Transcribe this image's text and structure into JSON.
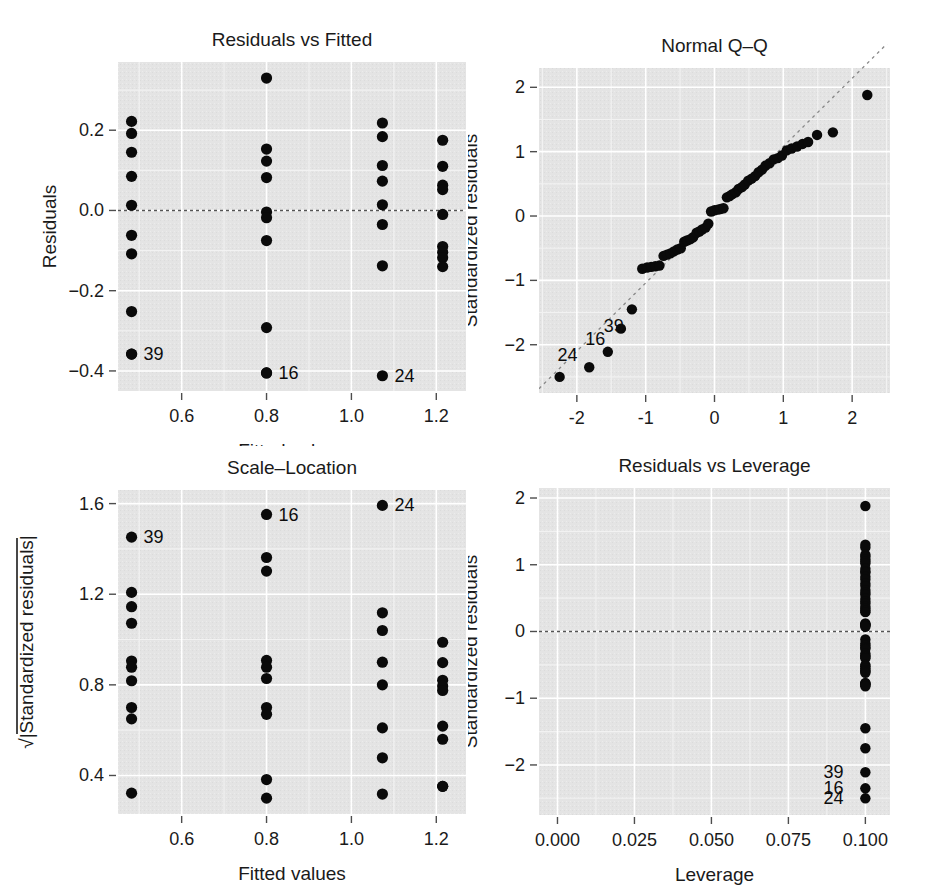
{
  "figure": {
    "width": 935,
    "height": 891,
    "background": "#ffffff",
    "panel_background": "#e4e4e4",
    "grid_color": "#ffffff",
    "point_color": "#0a0a0a",
    "reference_line_color": "#555555"
  },
  "chart_data": [
    {
      "id": "residuals-vs-fitted",
      "type": "scatter",
      "title": "Residuals vs Fitted",
      "xlabel": "Fitted values",
      "ylabel": "Residuals",
      "xlim": [
        0.45,
        1.27
      ],
      "ylim": [
        -0.45,
        0.37
      ],
      "xticks": [
        0.6,
        0.8,
        1.0,
        1.2
      ],
      "xticklabels": [
        "0.6",
        "0.8",
        "1.0",
        "1.2"
      ],
      "yticks": [
        0.2,
        0.0,
        -0.2,
        -0.4
      ],
      "yticklabels": [
        "0.2",
        "0.0",
        "-0.2",
        "-0.4"
      ],
      "grid": true,
      "legend": "none",
      "hline": 0.0,
      "x": [
        0.482,
        0.482,
        0.482,
        0.482,
        0.482,
        0.482,
        0.482,
        0.482,
        0.482,
        0.482,
        0.8,
        0.8,
        0.8,
        0.8,
        0.8,
        0.8,
        0.8,
        0.8,
        0.8,
        0.8,
        1.073,
        1.073,
        1.073,
        1.073,
        1.073,
        1.073,
        1.073,
        1.073,
        1.215,
        1.215,
        1.215,
        1.215,
        1.215,
        1.215,
        1.215,
        1.215,
        1.215
      ],
      "y": [
        0.222,
        0.192,
        0.145,
        0.085,
        0.013,
        -0.062,
        -0.108,
        -0.252,
        -0.358,
        -0.358,
        0.33,
        0.153,
        0.123,
        0.082,
        -0.004,
        -0.018,
        -0.075,
        -0.292,
        -0.405,
        -0.405,
        0.218,
        0.184,
        0.112,
        0.073,
        0.014,
        -0.035,
        -0.138,
        -0.412,
        0.175,
        0.11,
        0.063,
        0.052,
        -0.01,
        -0.09,
        -0.104,
        -0.118,
        -0.14
      ],
      "annotations": [
        {
          "label": "39",
          "x": 0.482,
          "y": -0.358,
          "dx": 12,
          "dy": 6
        },
        {
          "label": "16",
          "x": 0.8,
          "y": -0.405,
          "dx": 12,
          "dy": 6
        },
        {
          "label": "24",
          "x": 1.073,
          "y": -0.412,
          "dx": 12,
          "dy": 6
        }
      ]
    },
    {
      "id": "normal-qq",
      "type": "scatter",
      "title": "Normal Q-Q",
      "xlabel": "Theoretical quantiles",
      "ylabel": "Standardized residuals",
      "xlim": [
        -2.55,
        2.55
      ],
      "ylim": [
        -2.75,
        2.3
      ],
      "xticks": [
        -2,
        -1,
        0,
        1,
        2
      ],
      "xticklabels": [
        "-2",
        "-1",
        "0",
        "1",
        "2"
      ],
      "yticks": [
        2,
        1,
        0,
        -1,
        -2
      ],
      "yticklabels": [
        "2",
        "1",
        "0",
        "-1",
        "-2"
      ],
      "grid": true,
      "legend": "none",
      "qqline": {
        "slope": 1.06,
        "intercept": 0.02,
        "style": "dashed"
      },
      "x": [
        -2.25,
        -1.82,
        -1.55,
        -1.36,
        -1.2,
        -1.05,
        -0.98,
        -0.92,
        -0.86,
        -0.8,
        -0.74,
        -0.69,
        -0.64,
        -0.59,
        -0.54,
        -0.49,
        -0.44,
        -0.4,
        -0.35,
        -0.31,
        -0.26,
        -0.22,
        -0.18,
        -0.13,
        -0.09,
        -0.05,
        0.0,
        0.05,
        0.09,
        0.13,
        0.18,
        0.22,
        0.26,
        0.31,
        0.35,
        0.4,
        0.44,
        0.49,
        0.54,
        0.59,
        0.64,
        0.69,
        0.74,
        0.8,
        0.86,
        0.92,
        0.98,
        1.05,
        1.12,
        1.2,
        1.28,
        1.36,
        1.49,
        1.72,
        2.22
      ],
      "y": [
        -2.5,
        -2.35,
        -2.11,
        -1.75,
        -1.45,
        -0.82,
        -0.8,
        -0.79,
        -0.78,
        -0.77,
        -0.62,
        -0.6,
        -0.58,
        -0.55,
        -0.52,
        -0.5,
        -0.4,
        -0.38,
        -0.36,
        -0.33,
        -0.26,
        -0.24,
        -0.21,
        -0.18,
        -0.12,
        0.07,
        0.09,
        0.1,
        0.11,
        0.12,
        0.29,
        0.31,
        0.34,
        0.37,
        0.42,
        0.45,
        0.49,
        0.55,
        0.58,
        0.62,
        0.68,
        0.72,
        0.78,
        0.82,
        0.88,
        0.9,
        0.94,
        1.02,
        1.05,
        1.08,
        1.12,
        1.15,
        1.26,
        1.3,
        1.88
      ],
      "annotations": [
        {
          "label": "24",
          "x": -2.25,
          "y": -2.5,
          "dx": -2,
          "dy": -16
        },
        {
          "label": "16",
          "x": -1.82,
          "y": -2.35,
          "dx": -4,
          "dy": -22
        },
        {
          "label": "39",
          "x": -1.55,
          "y": -2.11,
          "dx": -4,
          "dy": -20
        }
      ]
    },
    {
      "id": "scale-location",
      "type": "scatter",
      "title": "Scale-Location",
      "xlabel": "Fitted values",
      "ylabel": "√|Standardized residuals|",
      "xlim": [
        0.45,
        1.27
      ],
      "ylim": [
        0.23,
        1.66
      ],
      "xticks": [
        0.6,
        0.8,
        1.0,
        1.2
      ],
      "xticklabels": [
        "0.6",
        "0.8",
        "1.0",
        "1.2"
      ],
      "yticks": [
        1.6,
        1.2,
        0.8,
        0.4
      ],
      "yticklabels": [
        "1.6",
        "1.2",
        "0.8",
        "0.4"
      ],
      "grid": true,
      "legend": "none",
      "x": [
        0.482,
        0.482,
        0.482,
        0.482,
        0.482,
        0.482,
        0.482,
        0.482,
        0.482,
        0.482,
        0.8,
        0.8,
        0.8,
        0.8,
        0.8,
        0.8,
        0.8,
        0.8,
        0.8,
        0.8,
        1.073,
        1.073,
        1.073,
        1.073,
        1.073,
        1.073,
        1.073,
        1.073,
        1.215,
        1.215,
        1.215,
        1.215,
        1.215,
        1.215,
        1.215,
        1.215,
        1.215
      ],
      "y": [
        1.452,
        1.208,
        1.145,
        1.072,
        0.905,
        0.878,
        0.818,
        0.7,
        0.65,
        0.322,
        1.552,
        1.362,
        1.302,
        0.908,
        0.878,
        0.828,
        0.7,
        0.67,
        0.382,
        0.3,
        1.592,
        1.118,
        1.04,
        0.9,
        0.8,
        0.61,
        0.478,
        0.318,
        0.988,
        0.898,
        0.82,
        0.795,
        0.775,
        0.618,
        0.56,
        0.352,
        0.352
      ],
      "annotations": [
        {
          "label": "39",
          "x": 0.482,
          "y": 1.452,
          "dx": 12,
          "dy": 6
        },
        {
          "label": "16",
          "x": 0.8,
          "y": 1.552,
          "dx": 12,
          "dy": 6
        },
        {
          "label": "24",
          "x": 1.073,
          "y": 1.592,
          "dx": 12,
          "dy": 6
        }
      ]
    },
    {
      "id": "residuals-vs-leverage",
      "type": "scatter",
      "title": "Residuals vs Leverage",
      "xlabel": "Leverage",
      "ylabel": "Standardized residuals",
      "xlim": [
        -0.006,
        0.108
      ],
      "ylim": [
        -2.75,
        2.15
      ],
      "xticks": [
        0.0,
        0.025,
        0.05,
        0.075,
        0.1
      ],
      "xticklabels": [
        "0.000",
        "0.025",
        "0.050",
        "0.075",
        "0.100"
      ],
      "yticks": [
        2,
        1,
        0,
        -1,
        -2
      ],
      "yticklabels": [
        "2",
        "1",
        "0",
        "-1",
        "-2"
      ],
      "grid": true,
      "legend": "none",
      "hline": 0.0,
      "x": [
        0.1,
        0.1,
        0.1,
        0.1,
        0.1,
        0.1,
        0.1,
        0.1,
        0.1,
        0.1,
        0.1,
        0.1,
        0.1,
        0.1,
        0.1,
        0.1,
        0.1,
        0.1,
        0.1,
        0.1,
        0.1,
        0.1,
        0.1,
        0.1,
        0.1,
        0.1,
        0.1,
        0.1,
        0.1,
        0.1,
        0.1,
        0.1,
        0.1,
        0.1,
        0.1,
        0.1,
        0.1,
        0.1,
        0.1,
        0.1,
        0.1,
        0.1,
        0.1,
        0.1,
        0.1,
        0.1,
        0.1,
        0.1,
        0.1,
        0.1,
        0.1,
        0.1,
        0.1,
        0.1,
        0.1
      ],
      "y": [
        1.88,
        1.3,
        1.26,
        1.15,
        1.12,
        1.08,
        1.05,
        1.02,
        0.94,
        0.9,
        0.88,
        0.82,
        0.78,
        0.72,
        0.68,
        0.62,
        0.58,
        0.55,
        0.49,
        0.45,
        0.42,
        0.37,
        0.34,
        0.31,
        0.29,
        0.12,
        0.11,
        0.1,
        0.09,
        0.07,
        -0.12,
        -0.18,
        -0.21,
        -0.24,
        -0.26,
        -0.33,
        -0.36,
        -0.38,
        -0.4,
        -0.5,
        -0.52,
        -0.55,
        -0.58,
        -0.6,
        -0.62,
        -0.77,
        -0.78,
        -0.79,
        -0.8,
        -0.82,
        -1.45,
        -1.75,
        -2.11,
        -2.35,
        -2.5
      ],
      "annotations": [
        {
          "label": "39",
          "x": 0.1,
          "y": -2.11,
          "dx": -42,
          "dy": 6
        },
        {
          "label": "16",
          "x": 0.1,
          "y": -2.35,
          "dx": -42,
          "dy": 6
        },
        {
          "label": "24",
          "x": 0.1,
          "y": -2.5,
          "dx": -42,
          "dy": 6
        }
      ]
    }
  ]
}
